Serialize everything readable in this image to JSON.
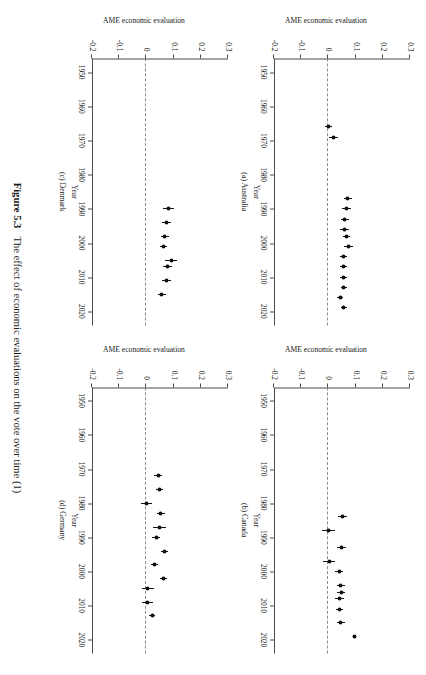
{
  "figure": {
    "number": "Figure 5.3",
    "caption": "The effect of economic evaluations on the vote over time (1)"
  },
  "axis": {
    "ylabel": "AME economic evaluation",
    "xlabel": "Year",
    "yticks": [
      "0.3",
      "0.2",
      "0.1",
      "0",
      "-0.1",
      "-0.2"
    ],
    "ytick_values": [
      0.3,
      0.2,
      0.1,
      0,
      -0.1,
      -0.2
    ],
    "xticks": [
      "1950",
      "1960",
      "1970",
      "1980",
      "1990",
      "2000",
      "2010",
      "2020"
    ],
    "xtick_values": [
      1950,
      1960,
      1970,
      1980,
      1990,
      2000,
      2010,
      2020
    ],
    "ylim": [
      -0.2,
      0.3
    ],
    "xlim": [
      1946,
      2024
    ]
  },
  "panels": [
    {
      "key": "australia",
      "caption": "(a) Australia"
    },
    {
      "key": "canada",
      "caption": "(b) Canada"
    },
    {
      "key": "denmark",
      "caption": "(c) Denmark"
    },
    {
      "key": "germany",
      "caption": "(d) Germany"
    }
  ],
  "chart_data": {
    "type": "scatter",
    "title": "The effect of economic evaluations on the vote over time (1)",
    "xlabel": "Year",
    "ylabel": "AME economic evaluation",
    "xlim": [
      1946,
      2024
    ],
    "ylim": [
      -0.2,
      0.3
    ],
    "grid": false,
    "legend": null,
    "annotations": [
      "dashed horizontal reference line at y = 0"
    ],
    "marker": "filled circle with horizontal 95% confidence interval bars",
    "panels": [
      {
        "label": "(a) Australia",
        "country": "Australia",
        "points": [
          {
            "x": 1966,
            "y": 0.0,
            "lo": -0.012,
            "hi": 0.012
          },
          {
            "x": 1969,
            "y": 0.018,
            "lo": 0.003,
            "hi": 0.034
          },
          {
            "x": 1987,
            "y": 0.072,
            "lo": 0.058,
            "hi": 0.086
          },
          {
            "x": 1990,
            "y": 0.066,
            "lo": 0.05,
            "hi": 0.082
          },
          {
            "x": 1993,
            "y": 0.06,
            "lo": 0.046,
            "hi": 0.074
          },
          {
            "x": 1996,
            "y": 0.06,
            "lo": 0.044,
            "hi": 0.076
          },
          {
            "x": 1998,
            "y": 0.067,
            "lo": 0.053,
            "hi": 0.081
          },
          {
            "x": 2001,
            "y": 0.074,
            "lo": 0.058,
            "hi": 0.09
          },
          {
            "x": 2004,
            "y": 0.056,
            "lo": 0.044,
            "hi": 0.068
          },
          {
            "x": 2007,
            "y": 0.055,
            "lo": 0.043,
            "hi": 0.067
          },
          {
            "x": 2010,
            "y": 0.056,
            "lo": 0.044,
            "hi": 0.068
          },
          {
            "x": 2013,
            "y": 0.057,
            "lo": 0.045,
            "hi": 0.069
          },
          {
            "x": 2016,
            "y": 0.043,
            "lo": 0.031,
            "hi": 0.055
          },
          {
            "x": 2019,
            "y": 0.057,
            "lo": 0.045,
            "hi": 0.069
          }
        ]
      },
      {
        "label": "(b) Canada",
        "country": "Canada",
        "points": [
          {
            "x": 1984,
            "y": 0.052,
            "lo": 0.036,
            "hi": 0.068
          },
          {
            "x": 1988,
            "y": 0.002,
            "lo": -0.022,
            "hi": 0.026
          },
          {
            "x": 1993,
            "y": 0.048,
            "lo": 0.03,
            "hi": 0.066
          },
          {
            "x": 1997,
            "y": 0.003,
            "lo": -0.019,
            "hi": 0.025
          },
          {
            "x": 2000,
            "y": 0.039,
            "lo": 0.025,
            "hi": 0.053
          },
          {
            "x": 2004,
            "y": 0.046,
            "lo": 0.031,
            "hi": 0.061
          },
          {
            "x": 2006,
            "y": 0.047,
            "lo": 0.033,
            "hi": 0.061
          },
          {
            "x": 2008,
            "y": 0.041,
            "lo": 0.025,
            "hi": 0.057
          },
          {
            "x": 2011,
            "y": 0.041,
            "lo": 0.027,
            "hi": 0.055
          },
          {
            "x": 2015,
            "y": 0.046,
            "lo": 0.032,
            "hi": 0.06
          },
          {
            "x": 2019,
            "y": 0.097,
            "lo": 0.091,
            "hi": 0.103
          }
        ]
      },
      {
        "label": "(c) Denmark",
        "country": "Denmark",
        "points": [
          {
            "x": 1990,
            "y": 0.082,
            "lo": 0.062,
            "hi": 0.102
          },
          {
            "x": 1994,
            "y": 0.074,
            "lo": 0.058,
            "hi": 0.09
          },
          {
            "x": 1998,
            "y": 0.068,
            "lo": 0.054,
            "hi": 0.082
          },
          {
            "x": 2001,
            "y": 0.063,
            "lo": 0.049,
            "hi": 0.077
          },
          {
            "x": 2005,
            "y": 0.092,
            "lo": 0.07,
            "hi": 0.112
          },
          {
            "x": 2007,
            "y": 0.077,
            "lo": 0.061,
            "hi": 0.093
          },
          {
            "x": 2011,
            "y": 0.074,
            "lo": 0.058,
            "hi": 0.09
          },
          {
            "x": 2015,
            "y": 0.057,
            "lo": 0.043,
            "hi": 0.071
          }
        ]
      },
      {
        "label": "(d) Germany",
        "country": "Germany",
        "points": [
          {
            "x": 1972,
            "y": 0.043,
            "lo": 0.029,
            "hi": 0.057
          },
          {
            "x": 1976,
            "y": 0.048,
            "lo": 0.034,
            "hi": 0.062
          },
          {
            "x": 1980,
            "y": 0.001,
            "lo": -0.019,
            "hi": 0.021
          },
          {
            "x": 1983,
            "y": 0.053,
            "lo": 0.039,
            "hi": 0.067
          },
          {
            "x": 1987,
            "y": 0.048,
            "lo": 0.024,
            "hi": 0.072
          },
          {
            "x": 1990,
            "y": 0.036,
            "lo": 0.022,
            "hi": 0.05
          },
          {
            "x": 1994,
            "y": 0.066,
            "lo": 0.052,
            "hi": 0.08
          },
          {
            "x": 1998,
            "y": 0.029,
            "lo": 0.017,
            "hi": 0.041
          },
          {
            "x": 2002,
            "y": 0.062,
            "lo": 0.05,
            "hi": 0.074
          },
          {
            "x": 2005,
            "y": 0.005,
            "lo": -0.017,
            "hi": 0.027
          },
          {
            "x": 2009,
            "y": 0.004,
            "lo": -0.016,
            "hi": 0.024
          },
          {
            "x": 2013,
            "y": 0.021,
            "lo": 0.009,
            "hi": 0.033
          }
        ]
      }
    ]
  }
}
